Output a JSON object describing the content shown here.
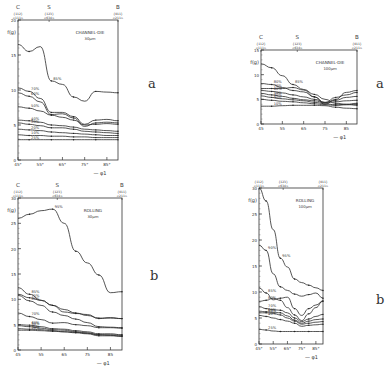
{
  "figure": {
    "panel_letters": [
      "a",
      "b",
      "a",
      "b"
    ]
  },
  "chart_data": [
    {
      "id": "channel-die-30",
      "type": "line",
      "title": "CHANNEL-DIE",
      "subtitle": "30µm",
      "ylabel": "f(g)",
      "xlabel": "φ1",
      "x": [
        45,
        50,
        55,
        60,
        65,
        70,
        75,
        80,
        85,
        90
      ],
      "xticks": [
        "45°",
        "55°",
        "65°",
        "75°",
        "85°"
      ],
      "xtick_values": [
        45,
        55,
        65,
        75,
        85
      ],
      "xlim": [
        45,
        90
      ],
      "ylim": [
        0,
        20
      ],
      "yticks": [
        0,
        5,
        10,
        15,
        20
      ],
      "top_markers": [
        {
          "label": "C",
          "sub1": "{112}",
          "sub2": "<111>",
          "x": 45
        },
        {
          "label": "S",
          "sub1": "{123}",
          "sub2": "<634>",
          "x": 59
        },
        {
          "label": "B",
          "sub1": "{011}",
          "sub2": "<211>",
          "x": 90
        }
      ],
      "series": [
        {
          "name": "85%",
          "values": [
            16.5,
            15.5,
            16.2,
            11.3,
            10.8,
            9.0,
            8.4,
            9.8,
            9.7,
            9.6
          ]
        },
        {
          "name": "70%",
          "values": [
            10.3,
            9.8,
            8.8,
            6.8,
            6.8,
            6.2,
            5.1,
            5.7,
            5.8,
            5.6
          ]
        },
        {
          "name": "60%",
          "values": [
            9.6,
            9.1,
            8.3,
            6.5,
            6.6,
            6.0,
            4.8,
            5.3,
            5.4,
            5.3
          ]
        },
        {
          "name": "50%",
          "values": [
            7.6,
            7.4,
            7.0,
            6.4,
            6.1,
            5.7,
            5.0,
            5.1,
            5.2,
            5.1
          ]
        },
        {
          "name": "40%",
          "values": [
            5.7,
            5.6,
            5.4,
            5.0,
            4.9,
            4.7,
            4.4,
            4.3,
            4.2,
            4.1
          ]
        },
        {
          "name": "30%",
          "values": [
            5.3,
            5.1,
            4.9,
            4.6,
            4.6,
            4.4,
            4.1,
            4.0,
            3.9,
            3.8
          ]
        },
        {
          "name": "20%",
          "values": [
            4.4,
            4.3,
            4.2,
            4.0,
            3.9,
            3.8,
            3.7,
            3.6,
            3.5,
            3.5
          ]
        },
        {
          "name": "10%",
          "values": [
            3.6,
            3.5,
            3.5,
            3.4,
            3.4,
            3.3,
            3.3,
            3.2,
            3.2,
            3.2
          ]
        },
        {
          "name": "25%",
          "values": [
            2.9,
            2.9,
            2.9,
            2.9,
            2.9,
            2.9,
            2.9,
            2.9,
            2.9,
            2.9
          ]
        }
      ]
    },
    {
      "id": "rolling-30",
      "type": "line",
      "title": "ROLLING",
      "subtitle": "30µm",
      "ylabel": "f(g)",
      "xlabel": "φ1",
      "x": [
        45,
        50,
        55,
        60,
        65,
        70,
        75,
        80,
        85,
        90
      ],
      "xticks": [
        "45",
        "55",
        "65",
        "75",
        "85"
      ],
      "xtick_values": [
        45,
        55,
        65,
        75,
        85
      ],
      "xlim": [
        45,
        90
      ],
      "ylim": [
        0,
        30
      ],
      "yticks": [
        0,
        5,
        10,
        15,
        20,
        25,
        30
      ],
      "top_markers": [
        {
          "label": "C",
          "sub1": "{112}",
          "sub2": "<111>",
          "x": 45
        },
        {
          "label": "S",
          "sub1": "{123}",
          "sub2": "<634>",
          "x": 62
        },
        {
          "label": "B",
          "sub1": "{011}",
          "sub2": "<211>",
          "x": 90
        }
      ],
      "series": [
        {
          "name": "95%",
          "values": [
            26.0,
            26.8,
            27.5,
            27.8,
            25.0,
            19.5,
            17.2,
            14.8,
            11.3,
            11.5
          ]
        },
        {
          "name": "85%",
          "values": [
            12.3,
            11.0,
            9.8,
            8.8,
            7.5,
            7.2,
            7.0,
            6.2,
            6.4,
            6.2
          ]
        },
        {
          "name": "75%",
          "values": [
            11.0,
            10.3,
            9.8,
            8.8,
            8.0,
            7.3,
            6.8,
            6.3,
            6.3,
            6.2
          ]
        },
        {
          "name": "80%",
          "values": [
            10.8,
            9.7,
            8.8,
            7.5,
            6.8,
            6.1,
            5.4,
            4.6,
            4.5,
            4.4
          ]
        },
        {
          "name": "70%",
          "values": [
            7.3,
            6.6,
            6.0,
            5.3,
            5.4,
            5.0,
            4.8,
            4.4,
            4.4,
            4.3
          ]
        },
        {
          "name": "60%",
          "values": [
            5.0,
            4.9,
            4.6,
            4.2,
            4.1,
            3.8,
            3.6,
            3.2,
            3.2,
            3.0
          ]
        },
        {
          "name": "50%",
          "values": [
            4.8,
            4.6,
            4.3,
            4.0,
            3.9,
            3.6,
            3.4,
            3.0,
            3.0,
            2.9
          ]
        },
        {
          "name": "30%",
          "values": [
            4.2,
            4.1,
            4.0,
            3.8,
            3.6,
            3.4,
            3.2,
            2.8,
            2.8,
            2.7
          ]
        },
        {
          "name": "20%",
          "values": [
            3.9,
            3.9,
            3.8,
            3.7,
            3.6,
            3.5,
            3.3,
            3.0,
            2.9,
            2.7
          ]
        }
      ]
    },
    {
      "id": "channel-die-100",
      "type": "line",
      "title": "CHANNEL-DIE",
      "subtitle": "100µm",
      "ylabel": "f(g)",
      "xlabel": "φ1",
      "x": [
        45,
        50,
        55,
        60,
        65,
        70,
        75,
        80,
        85,
        90
      ],
      "xticks": [
        "45",
        "55",
        "65",
        "75",
        "85"
      ],
      "xtick_values": [
        45,
        55,
        65,
        75,
        85
      ],
      "xlim": [
        45,
        90
      ],
      "ylim": [
        0,
        15
      ],
      "yticks": [
        0,
        5,
        10,
        15
      ],
      "top_markers": [
        {
          "label": "C",
          "sub1": "{112}",
          "sub2": "<111>",
          "x": 45
        },
        {
          "label": "S",
          "sub1": "{123}",
          "sub2": "<634>",
          "x": 62
        },
        {
          "label": "B",
          "sub1": "{011}",
          "sub2": "<211>",
          "x": 90
        }
      ],
      "series": [
        {
          "name": "85%",
          "values": [
            12.2,
            11.4,
            9.8,
            8.0,
            7.0,
            6.0,
            5.0,
            4.2,
            4.0,
            3.8
          ]
        },
        {
          "name": "80%",
          "values": [
            8.2,
            8.0,
            7.4,
            6.8,
            6.5,
            5.5,
            4.0,
            5.0,
            6.4,
            6.8
          ]
        },
        {
          "name": "70%",
          "values": [
            7.2,
            7.2,
            7.2,
            7.4,
            6.9,
            5.5,
            4.3,
            5.4,
            5.9,
            6.4
          ]
        },
        {
          "name": "60%",
          "values": [
            6.8,
            6.6,
            6.3,
            5.9,
            5.5,
            5.0,
            4.4,
            4.8,
            5.4,
            5.6
          ]
        },
        {
          "name": "50%",
          "values": [
            6.2,
            5.9,
            5.6,
            5.2,
            4.9,
            4.7,
            4.3,
            4.5,
            4.7,
            4.8
          ]
        },
        {
          "name": "40%",
          "values": [
            5.7,
            5.4,
            5.1,
            4.9,
            4.7,
            4.4,
            4.1,
            3.9,
            4.0,
            4.2
          ]
        },
        {
          "name": "30%",
          "values": [
            5.0,
            4.8,
            4.6,
            4.5,
            4.3,
            4.1,
            3.9,
            3.8,
            3.9,
            4.0
          ]
        },
        {
          "name": "10%",
          "values": [
            3.6,
            3.6,
            3.7,
            3.8,
            3.8,
            3.8,
            3.7,
            3.4,
            3.2,
            3.1
          ]
        }
      ]
    },
    {
      "id": "rolling-100",
      "type": "line",
      "title": "ROLLING",
      "subtitle": "100µm",
      "ylabel": "f(g)",
      "xlabel": "φ1",
      "x": [
        45,
        50,
        55,
        60,
        65,
        70,
        75,
        80,
        85,
        90
      ],
      "xticks": [
        "45°",
        "55°",
        "65°",
        "75°",
        "85°"
      ],
      "xtick_values": [
        45,
        55,
        65,
        75,
        85
      ],
      "xlim": [
        45,
        90
      ],
      "ylim": [
        0,
        30
      ],
      "yticks": [
        0,
        5,
        10,
        15,
        20,
        25,
        30
      ],
      "top_markers": [
        {
          "label": "C",
          "sub1": "{112}",
          "sub2": "<111>",
          "x": 45
        },
        {
          "label": "S",
          "sub1": "{123}",
          "sub2": "<634>",
          "x": 62
        },
        {
          "label": "B",
          "sub1": "{011}",
          "sub2": "<211>",
          "x": 90
        }
      ],
      "series": [
        {
          "name": "95%",
          "values": [
            30.0,
            27.5,
            22.0,
            16.5,
            14.8,
            12.5,
            11.8,
            11.3,
            10.8,
            10.3
          ]
        },
        {
          "name": "90%",
          "values": [
            19.0,
            18.0,
            13.5,
            11.0,
            10.3,
            9.6,
            9.2,
            9.5,
            9.8,
            8.8
          ]
        },
        {
          "name": "85%",
          "values": [
            10.8,
            9.8,
            8.5,
            8.8,
            9.0,
            6.8,
            5.5,
            6.8,
            7.5,
            8.2
          ]
        },
        {
          "name": "80%",
          "values": [
            8.2,
            8.4,
            8.8,
            8.4,
            7.0,
            5.6,
            4.5,
            5.8,
            7.0,
            8.3
          ]
        },
        {
          "name": "70%",
          "values": [
            7.2,
            6.8,
            6.6,
            6.5,
            6.0,
            5.0,
            4.3,
            4.8,
            5.3,
            5.7
          ]
        },
        {
          "name": "60%",
          "values": [
            6.3,
            6.2,
            6.1,
            6.0,
            5.4,
            4.6,
            4.0,
            4.4,
            4.7,
            4.8
          ]
        },
        {
          "name": "50%",
          "values": [
            6.0,
            6.0,
            5.9,
            5.6,
            5.0,
            4.4,
            3.8,
            4.0,
            4.2,
            4.3
          ]
        },
        {
          "name": "40%",
          "values": [
            5.5,
            5.3,
            5.0,
            4.7,
            4.4,
            4.0,
            3.4,
            3.6,
            3.7,
            3.8
          ]
        },
        {
          "name": "25%",
          "values": [
            2.8,
            2.7,
            2.5,
            2.4,
            2.4,
            2.4,
            2.4,
            2.4,
            2.4,
            2.4
          ]
        }
      ]
    }
  ]
}
